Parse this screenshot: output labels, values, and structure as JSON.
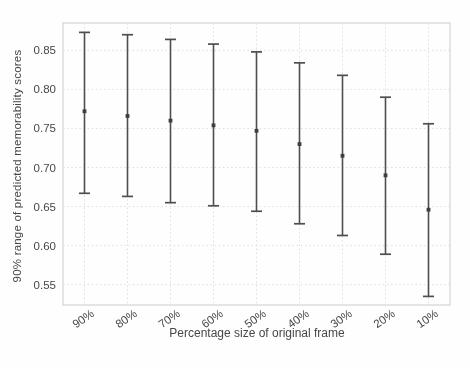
{
  "figure": {
    "background": "#fefefe",
    "frame_color": "#c8c8c8",
    "grid_color": "#dadada",
    "bar_color": "#4e4e4e",
    "marker_color": "#3e3e3e",
    "text_color": "#474747"
  },
  "chart_data": {
    "type": "scatter",
    "variant": "vertical-errorbar",
    "title": "",
    "xlabel": "Percentage size of original frame",
    "ylabel": "90% range of predicted memorability scores",
    "categories": [
      "90%",
      "80%",
      "70%",
      "60%",
      "50%",
      "40%",
      "30%",
      "20%",
      "10%"
    ],
    "series": [
      {
        "name": "90% prediction interval",
        "center": [
          0.772,
          0.766,
          0.76,
          0.754,
          0.747,
          0.73,
          0.715,
          0.69,
          0.646
        ],
        "low": [
          0.667,
          0.663,
          0.655,
          0.651,
          0.644,
          0.628,
          0.613,
          0.589,
          0.535
        ],
        "high": [
          0.873,
          0.87,
          0.864,
          0.858,
          0.848,
          0.834,
          0.818,
          0.79,
          0.756
        ]
      }
    ],
    "ytick_values": [
      0.55,
      0.6,
      0.65,
      0.7,
      0.75,
      0.8,
      0.85
    ],
    "ytick_labels": [
      "0.55",
      "0.60",
      "0.65",
      "0.70",
      "0.75",
      "0.80",
      "0.85"
    ],
    "ylim": [
      0.524,
      0.885
    ],
    "grid": true,
    "grid_style": "dotted",
    "legend": "none",
    "x_tick_rotation_deg": -35
  }
}
